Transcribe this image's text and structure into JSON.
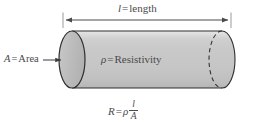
{
  "figure": {
    "name": "resistivity-cylinder-diagram",
    "type": "diagram",
    "background_color": "#ffffff",
    "ink_color": "#4a4a4a",
    "labels": {
      "length_symbol": "l",
      "length_equals": "=",
      "length_text": "length",
      "area_symbol": "A",
      "area_equals": "=",
      "area_text": "Area",
      "rho_symbol": "ρ",
      "rho_equals": "=",
      "rho_text": "Resistivity",
      "formula_lhs": "R",
      "formula_equals": "=",
      "formula_rho": "ρ",
      "formula_numerator": "l",
      "formula_denominator": "A"
    },
    "geometry": {
      "cylinder_fill_light": "#d8d8d8",
      "cylinder_fill_mid": "#c4c4c4",
      "cylinder_fill_dark": "#b8b8b8",
      "end_cap_fill": "#bdbdbd",
      "outline_color": "#2e2e2e",
      "dimension_line_color": "#4a4a4a",
      "body_left_x": 72,
      "body_right_x": 222,
      "body_top_y": 31,
      "body_bottom_y": 88,
      "cap_radius_x": 13,
      "cap_radius_y": 28.5,
      "dimension_line_y": 20,
      "dimension_left_x": 63,
      "dimension_right_x": 231,
      "area_arrow_y": 60,
      "area_arrow_from_x": 43,
      "area_arrow_to_x": 62
    }
  }
}
